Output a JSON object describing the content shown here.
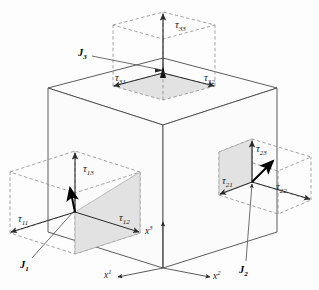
{
  "figure": {
    "type": "stress-tensor-cube-diagram",
    "colors": {
      "background": "#fdfdfd",
      "cube_line": "#4a4a4a",
      "cube_face": "#fbfbfb",
      "shaded_face": "#e2e2e2",
      "dashed_line": "#8a8a8a",
      "arrow": "#2a2a2a",
      "bold_arrow": "#000000",
      "text": "#1a1a1a"
    }
  },
  "axes": [
    {
      "name": "x1",
      "base": "x",
      "sup": "1"
    },
    {
      "name": "x2",
      "base": "x",
      "sup": "2"
    },
    {
      "name": "x3",
      "base": "x",
      "sup": "3"
    }
  ],
  "tractions": [
    {
      "name": "J1",
      "base": "J",
      "sub": "1"
    },
    {
      "name": "J2",
      "base": "J",
      "sub": "2"
    },
    {
      "name": "J3",
      "base": "J",
      "sub": "3"
    }
  ],
  "components": [
    {
      "name": "tau11",
      "base": "τ",
      "sub": "11"
    },
    {
      "name": "tau12",
      "base": "τ",
      "sub": "12"
    },
    {
      "name": "tau13",
      "base": "τ",
      "sub": "13"
    },
    {
      "name": "tau21",
      "base": "τ",
      "sub": "21"
    },
    {
      "name": "tau22",
      "base": "τ",
      "sub": "22"
    },
    {
      "name": "tau23",
      "base": "τ",
      "sub": "23"
    },
    {
      "name": "tau31",
      "base": "τ",
      "sub": "31"
    },
    {
      "name": "tau32",
      "base": "τ",
      "sub": "32"
    },
    {
      "name": "tau33",
      "base": "τ",
      "sub": "33"
    }
  ],
  "labels": {
    "tau11": "τ",
    "tau11_sub": "11",
    "tau12": "τ",
    "tau12_sub": "12",
    "tau13": "τ",
    "tau13_sub": "13",
    "tau21": "τ",
    "tau21_sub": "21",
    "tau22": "τ",
    "tau22_sub": "22",
    "tau23": "τ",
    "tau23_sub": "23",
    "tau31": "τ",
    "tau31_sub": "31",
    "tau32": "τ",
    "tau32_sub": "32",
    "tau33": "τ",
    "tau33_sub": "33",
    "J1": "J",
    "J1_sub": "1",
    "J2": "J",
    "J2_sub": "2",
    "J3": "J",
    "J3_sub": "3",
    "x1": "x",
    "x1_sup": "1",
    "x2": "x",
    "x2_sup": "2",
    "x3": "x",
    "x3_sup": "3"
  }
}
